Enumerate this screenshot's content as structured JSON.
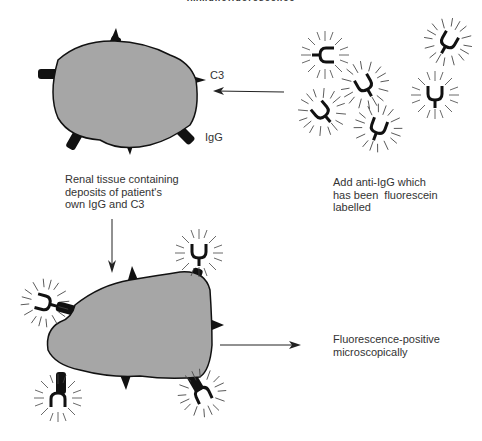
{
  "title": "Immunofluorescence",
  "labels": {
    "c3": "C3",
    "igg": "IgG",
    "renal_tissue": "Renal tissue containing\ndeposits of patient's\nown IgG and C3",
    "add_anti_igg": "Add anti-IgG which\nhas been  fluorescein\nlabelled",
    "result": "Fluorescence-positive\nmicroscopically"
  },
  "colors": {
    "tissue_fill": "#a6a6a6",
    "outline": "#111111",
    "text": "#333333"
  },
  "icons": {
    "tissue": "renal-tissue-blob",
    "antibody": "fluorescent-anti-igg-y-shape",
    "arrow": "arrow"
  }
}
